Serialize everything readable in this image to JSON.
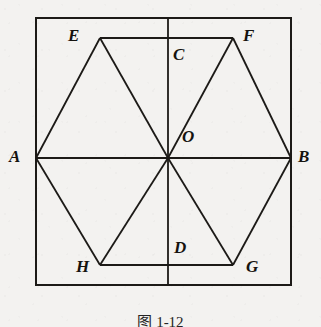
{
  "figure": {
    "caption": "图 1-12",
    "background_color": "#f3f2f0",
    "stroke_color": "#1c1a17",
    "label_color": "#15130f"
  },
  "labels": {
    "A": "A",
    "B": "B",
    "C": "C",
    "D": "D",
    "E": "E",
    "F": "F",
    "G": "G",
    "H": "H",
    "O": "O"
  },
  "geometry": {
    "square": {
      "name": "outer-square",
      "x": 36,
      "y": 18,
      "width": 255,
      "height": 267
    },
    "points": {
      "A": {
        "x": 36,
        "y": 158
      },
      "B": {
        "x": 291,
        "y": 158
      },
      "C": {
        "x": 168,
        "y": 18
      },
      "D": {
        "x": 168,
        "y": 285
      },
      "E": {
        "x": 100,
        "y": 38
      },
      "F": {
        "x": 233,
        "y": 38
      },
      "G": {
        "x": 233,
        "y": 265
      },
      "H": {
        "x": 100,
        "y": 265
      },
      "O": {
        "x": 168,
        "y": 158
      }
    },
    "label_positions": {
      "A": {
        "x": 9,
        "y": 148
      },
      "B": {
        "x": 298,
        "y": 148
      },
      "C": {
        "x": 173,
        "y": 46
      },
      "D": {
        "x": 174,
        "y": 239
      },
      "E": {
        "x": 68,
        "y": 27
      },
      "F": {
        "x": 243,
        "y": 27
      },
      "G": {
        "x": 246,
        "y": 258
      },
      "H": {
        "x": 76,
        "y": 258
      },
      "O": {
        "x": 182,
        "y": 128
      }
    },
    "segments": [
      {
        "name": "hexagon-side-AE",
        "from": "A",
        "to": "E"
      },
      {
        "name": "hexagon-side-EF",
        "from": "E",
        "to": "F"
      },
      {
        "name": "hexagon-side-FB",
        "from": "F",
        "to": "B"
      },
      {
        "name": "hexagon-side-BG",
        "from": "B",
        "to": "G"
      },
      {
        "name": "hexagon-side-GH",
        "from": "G",
        "to": "H"
      },
      {
        "name": "hexagon-side-HA",
        "from": "H",
        "to": "A"
      },
      {
        "name": "diagonal-AB",
        "from": "A",
        "to": "B"
      },
      {
        "name": "diagonal-CD",
        "from": "C",
        "to": "D"
      },
      {
        "name": "radius-OE",
        "from": "O",
        "to": "E"
      },
      {
        "name": "radius-OF",
        "from": "O",
        "to": "F"
      },
      {
        "name": "radius-OG",
        "from": "O",
        "to": "G"
      },
      {
        "name": "radius-OH",
        "from": "O",
        "to": "H"
      }
    ]
  }
}
